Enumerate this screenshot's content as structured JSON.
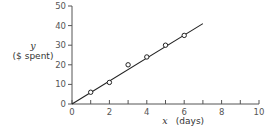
{
  "chart_data": {
    "type": "scatter",
    "title": "",
    "xlabel": "x  (days)",
    "xlabel_var": "x",
    "xlabel_unit": "(days)",
    "ylabel": "y ($ spent)",
    "ylabel_var": "y",
    "ylabel_unit": "($ spent)",
    "xlim": [
      0,
      10
    ],
    "ylim": [
      0,
      50
    ],
    "x_ticks": [
      0,
      2,
      4,
      6,
      8,
      10
    ],
    "x_minor_ticks": [
      1,
      3,
      5,
      7,
      9
    ],
    "y_ticks": [
      0,
      10,
      20,
      30,
      40,
      50
    ],
    "grid": false,
    "legend": null,
    "series": [
      {
        "name": "observations",
        "marker": "open-circle",
        "x": [
          1,
          2,
          3,
          4,
          5,
          6
        ],
        "y": [
          6,
          11,
          20,
          24,
          30,
          35
        ]
      },
      {
        "name": "fit line",
        "style": "line",
        "x": [
          0,
          7
        ],
        "y": [
          0,
          41
        ]
      }
    ]
  },
  "colors": {
    "axis": "#555555",
    "line": "#222222",
    "marker": "#222222",
    "background": "#ffffff"
  }
}
